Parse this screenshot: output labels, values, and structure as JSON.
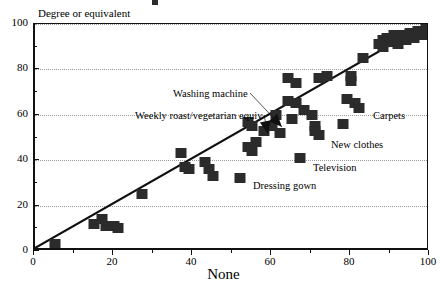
{
  "chart_data": {
    "type": "scatter",
    "title": "",
    "xlabel": "None",
    "ylabel": "Degree or equivalent",
    "xlim": [
      0,
      100
    ],
    "ylim": [
      0,
      100
    ],
    "xticks": [
      0,
      20,
      40,
      60,
      80,
      100
    ],
    "yticks": [
      0,
      20,
      40,
      60,
      80,
      100
    ],
    "grid": "horizontal-dotted",
    "legend": "none",
    "reference_line": {
      "label": "y = x identity line",
      "from": [
        0,
        0
      ],
      "to": [
        100,
        100
      ]
    },
    "points": [
      {
        "x": 5,
        "y": 3
      },
      {
        "x": 15,
        "y": 12
      },
      {
        "x": 17,
        "y": 14
      },
      {
        "x": 18,
        "y": 11
      },
      {
        "x": 20,
        "y": 11
      },
      {
        "x": 21,
        "y": 10
      },
      {
        "x": 27,
        "y": 25
      },
      {
        "x": 37,
        "y": 43
      },
      {
        "x": 38,
        "y": 37
      },
      {
        "x": 39,
        "y": 36
      },
      {
        "x": 43,
        "y": 39
      },
      {
        "x": 44,
        "y": 36
      },
      {
        "x": 45,
        "y": 33
      },
      {
        "x": 52,
        "y": 32
      },
      {
        "x": 54,
        "y": 57
      },
      {
        "x": 54,
        "y": 46
      },
      {
        "x": 55,
        "y": 55
      },
      {
        "x": 55,
        "y": 44
      },
      {
        "x": 56,
        "y": 48
      },
      {
        "x": 58,
        "y": 53
      },
      {
        "x": 60,
        "y": 55
      },
      {
        "x": 61,
        "y": 60
      },
      {
        "x": 62,
        "y": 52
      },
      {
        "x": 64,
        "y": 76
      },
      {
        "x": 64,
        "y": 66
      },
      {
        "x": 65,
        "y": 58
      },
      {
        "x": 66,
        "y": 74
      },
      {
        "x": 66,
        "y": 65
      },
      {
        "x": 67,
        "y": 41
      },
      {
        "x": 68,
        "y": 62
      },
      {
        "x": 70,
        "y": 60
      },
      {
        "x": 71,
        "y": 55
      },
      {
        "x": 71,
        "y": 53
      },
      {
        "x": 72,
        "y": 76
      },
      {
        "x": 72,
        "y": 51
      },
      {
        "x": 74,
        "y": 77
      },
      {
        "x": 78,
        "y": 56
      },
      {
        "x": 79,
        "y": 67
      },
      {
        "x": 80,
        "y": 77
      },
      {
        "x": 80,
        "y": 75
      },
      {
        "x": 81,
        "y": 65
      },
      {
        "x": 82,
        "y": 63
      },
      {
        "x": 83,
        "y": 85
      },
      {
        "x": 87,
        "y": 91
      },
      {
        "x": 88,
        "y": 93
      },
      {
        "x": 88,
        "y": 90
      },
      {
        "x": 89,
        "y": 94
      },
      {
        "x": 90,
        "y": 92
      },
      {
        "x": 91,
        "y": 95
      },
      {
        "x": 92,
        "y": 91
      },
      {
        "x": 93,
        "y": 95
      },
      {
        "x": 94,
        "y": 93
      },
      {
        "x": 95,
        "y": 96
      },
      {
        "x": 96,
        "y": 94
      },
      {
        "x": 97,
        "y": 97
      },
      {
        "x": 98,
        "y": 95
      },
      {
        "x": 99,
        "y": 98
      }
    ],
    "annotations": [
      {
        "id": "washing-machine",
        "label": "Washing  machine",
        "text_x": 173,
        "text_y": 88,
        "leader_to_x": 282,
        "leader_to_y": 127,
        "arrow": true
      },
      {
        "id": "weekly-roast",
        "label": "Weekly roast/vegetarian equiv",
        "text_x": 135,
        "text_y": 110,
        "leader_to_x": 268,
        "leader_to_y": 134,
        "arrow": true
      },
      {
        "id": "carpets",
        "label": "Carpets",
        "text_x": 373,
        "text_y": 110,
        "leader_to_x": null,
        "leader_to_y": null,
        "arrow": false
      },
      {
        "id": "new-clothes",
        "label": "New clothes",
        "text_x": 331,
        "text_y": 139,
        "leader_to_x": null,
        "leader_to_y": null,
        "arrow": false
      },
      {
        "id": "television",
        "label": "Television",
        "text_x": 313,
        "text_y": 162,
        "leader_to_x": null,
        "leader_to_y": null,
        "arrow": false
      },
      {
        "id": "dressing-gown",
        "label": "Dressing gown",
        "text_x": 253,
        "text_y": 180,
        "leader_to_x": null,
        "leader_to_y": null,
        "arrow": false
      }
    ]
  }
}
